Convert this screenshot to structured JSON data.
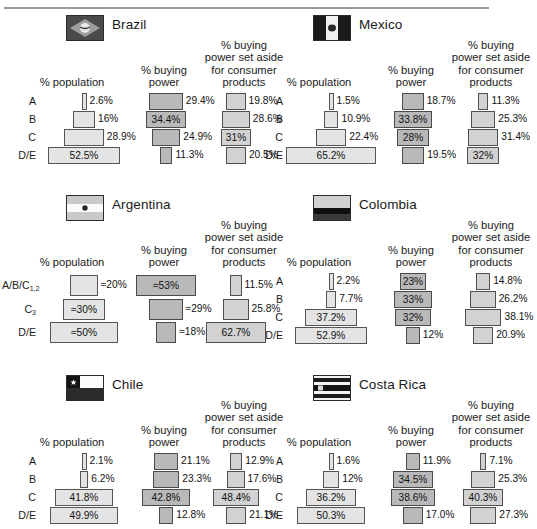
{
  "figure": {
    "column_captions": {
      "population": "% population",
      "buying_power": "% buying\npower",
      "consumer": "% buying\npower set aside\nfor consumer\nproducts"
    }
  },
  "chart_data": {
    "type": "bar",
    "layout": "3 column-centered pyramid bar charts per country panel, 6 country panels in a 2x3 grid",
    "columns": [
      "% population",
      "% buying power",
      "% buying power set aside for consumer products"
    ],
    "panels": [
      {
        "country": "Brazil",
        "flag": "brazil-flag-icon",
        "rows": [
          "A",
          "B",
          "C",
          "D/E"
        ],
        "series": [
          {
            "name": "% population",
            "values": [
              2.6,
              16,
              28.9,
              52.5
            ],
            "labels": [
              "2.6%",
              "16%",
              "28.9%",
              "52.5%"
            ],
            "label_inside": [
              false,
              false,
              false,
              true
            ]
          },
          {
            "name": "% buying power",
            "values": [
              29.4,
              34.4,
              24.9,
              11.3
            ],
            "labels": [
              "29.4%",
              "34.4%",
              "24.9%",
              "11.3%"
            ],
            "label_inside": [
              false,
              true,
              false,
              false
            ]
          },
          {
            "name": "% buying power set aside for consumer products",
            "values": [
              19.8,
              28.6,
              31,
              20.5
            ],
            "labels": [
              "19.8%",
              "28.6%",
              "31%",
              "20.5%"
            ],
            "label_inside": [
              false,
              false,
              true,
              false
            ]
          }
        ]
      },
      {
        "country": "Mexico",
        "flag": "mexico-flag-icon",
        "rows": [
          "A",
          "B",
          "C",
          "D/E"
        ],
        "series": [
          {
            "name": "% population",
            "values": [
              1.5,
              10.9,
              22.4,
              65.2
            ],
            "labels": [
              "1.5%",
              "10.9%",
              "22.4%",
              "65.2%"
            ],
            "label_inside": [
              false,
              false,
              false,
              true
            ]
          },
          {
            "name": "% buying power",
            "values": [
              18.7,
              33.8,
              28,
              19.5
            ],
            "labels": [
              "18.7%",
              "33.8%",
              "28%",
              "19.5%"
            ],
            "label_inside": [
              false,
              true,
              true,
              false
            ]
          },
          {
            "name": "% buying power set aside for consumer products",
            "values": [
              11.3,
              25.3,
              31.4,
              32
            ],
            "labels": [
              "11.3%",
              "25.3%",
              "31.4%",
              "32%"
            ],
            "label_inside": [
              false,
              false,
              false,
              true
            ]
          }
        ]
      },
      {
        "country": "Argentina",
        "country_superscript": "a",
        "flag": "argentina-flag-icon",
        "rows": [
          "A/B/C1,2",
          "C3",
          "D/E"
        ],
        "series": [
          {
            "name": "% population",
            "values": [
              20,
              30,
              50
            ],
            "labels": [
              "≈20%",
              "≈30%",
              "≈50%"
            ],
            "label_inside": [
              false,
              true,
              true
            ]
          },
          {
            "name": "% buying power",
            "values": [
              53,
              29,
              18
            ],
            "labels": [
              "≈53%",
              "≈29%",
              "≈18%"
            ],
            "label_inside": [
              true,
              false,
              false
            ]
          },
          {
            "name": "% buying power set aside for consumer products",
            "values": [
              11.5,
              25.8,
              62.7
            ],
            "labels": [
              "11.5%",
              "25.8%",
              "62.7%"
            ],
            "label_inside": [
              false,
              false,
              true
            ]
          }
        ]
      },
      {
        "country": "Colombia",
        "flag": "colombia-flag-icon",
        "rows": [
          "A",
          "B",
          "C",
          "D/E"
        ],
        "series": [
          {
            "name": "% population",
            "values": [
              2.2,
              7.7,
              37.2,
              52.9
            ],
            "labels": [
              "2.2%",
              "7.7%",
              "37.2%",
              "52.9%"
            ],
            "label_inside": [
              false,
              false,
              true,
              true
            ]
          },
          {
            "name": "% buying power",
            "values": [
              23,
              33,
              32,
              12
            ],
            "labels": [
              "23%",
              "33%",
              "32%",
              "12%"
            ],
            "label_inside": [
              true,
              true,
              true,
              false
            ]
          },
          {
            "name": "% buying power set aside for consumer products",
            "values": [
              14.8,
              26.2,
              38.1,
              20.9
            ],
            "labels": [
              "14.8%",
              "26.2%",
              "38.1%",
              "20.9%"
            ],
            "label_inside": [
              false,
              false,
              false,
              false
            ]
          }
        ]
      },
      {
        "country": "Chile",
        "flag": "chile-flag-icon",
        "rows": [
          "A",
          "B",
          "C",
          "D/E"
        ],
        "series": [
          {
            "name": "% population",
            "values": [
              2.1,
              6.2,
              41.8,
              49.9
            ],
            "labels": [
              "2.1%",
              "6.2%",
              "41.8%",
              "49.9%"
            ],
            "label_inside": [
              false,
              false,
              true,
              true
            ]
          },
          {
            "name": "% buying power",
            "values": [
              21.1,
              23.3,
              42.8,
              12.8
            ],
            "labels": [
              "21.1%",
              "23.3%",
              "42.8%",
              "12.8%"
            ],
            "label_inside": [
              false,
              false,
              true,
              false
            ]
          },
          {
            "name": "% buying power set aside for consumer products",
            "values": [
              12.9,
              17.6,
              48.4,
              21.1
            ],
            "labels": [
              "12.9%",
              "17.6%",
              "48.4%",
              "21.1%"
            ],
            "label_inside": [
              false,
              false,
              true,
              false
            ]
          }
        ]
      },
      {
        "country": "Costa Rica",
        "flag": "costa-rica-flag-icon",
        "rows": [
          "A",
          "B",
          "C",
          "D/E"
        ],
        "series": [
          {
            "name": "% population",
            "values": [
              1.6,
              12,
              36.2,
              50.3
            ],
            "labels": [
              "1.6%",
              "12%",
              "36.2%",
              "50.3%"
            ],
            "label_inside": [
              false,
              false,
              true,
              true
            ]
          },
          {
            "name": "% buying power",
            "values": [
              11.9,
              34.5,
              38.6,
              17.0
            ],
            "labels": [
              "11.9%",
              "34.5%",
              "38.6%",
              "17.0%"
            ],
            "label_inside": [
              false,
              true,
              true,
              false
            ]
          },
          {
            "name": "% buying power set aside for consumer products",
            "values": [
              7.1,
              25.3,
              40.3,
              27.3
            ],
            "labels": [
              "7.1%",
              "25.3%",
              "40.3%",
              "27.3%"
            ],
            "label_inside": [
              false,
              false,
              true,
              false
            ]
          }
        ]
      }
    ]
  }
}
